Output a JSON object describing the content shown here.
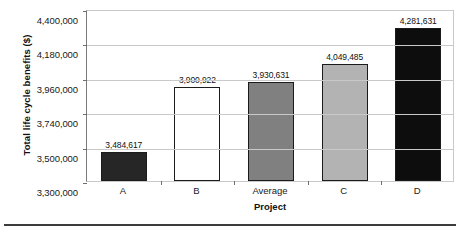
{
  "chart_data": {
    "type": "bar",
    "title": "",
    "xlabel": "Project",
    "ylabel": "Total life cycle benefits ($)",
    "categories": [
      "A",
      "B",
      "Average",
      "C",
      "D"
    ],
    "values": [
      3484617,
      3900922,
      3930631,
      4049485,
      4281631
    ],
    "value_labels": [
      "3,484,617",
      "3,900,922",
      "3,930,631",
      "4,049,485",
      "4,281,631"
    ],
    "ylim": [
      3300000,
      4400000
    ],
    "ytick_labels": [
      "4,400,000",
      "4,180,000",
      "3,960,000",
      "3,740,000",
      "3,500,000",
      "3,300,000"
    ],
    "ytick_values": [
      4400000,
      4180000,
      3960000,
      3740000,
      3500000,
      3300000
    ],
    "grid": true,
    "legend": "none",
    "bar_colors": [
      "#262626",
      "#ffffff",
      "#808080",
      "#b3b3b3",
      "#0d0d0d"
    ],
    "bar_edge_color": "#1b1b1b",
    "axis_color": "#7a7a7a",
    "grid_color": "#c9c9c9",
    "text_color": "#111111"
  }
}
